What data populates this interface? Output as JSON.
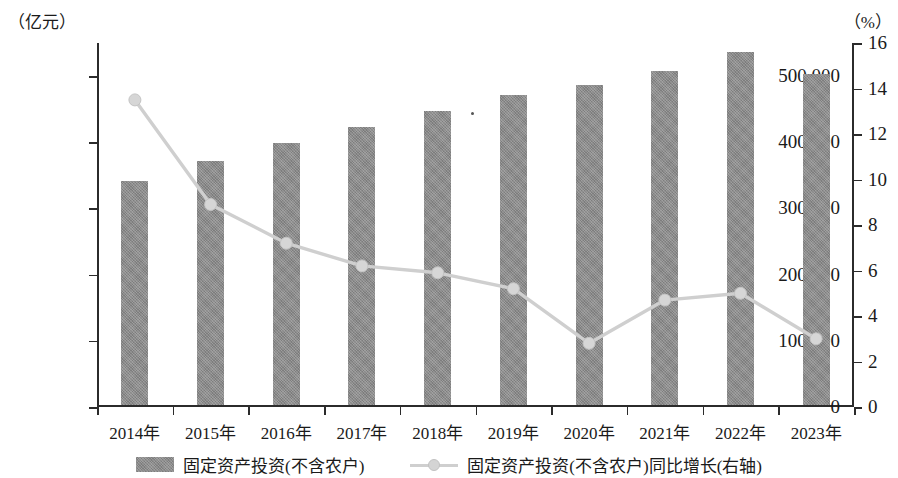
{
  "axes": {
    "left_unit": "（亿元）",
    "right_unit": "（%）",
    "left_ticks": [
      "0",
      "100 000",
      "200 000",
      "300 000",
      "400 000",
      "500 000"
    ],
    "right_ticks": [
      "0",
      "2",
      "4",
      "6",
      "8",
      "10",
      "12",
      "14",
      "16"
    ]
  },
  "legend": {
    "bar_label": "固定资产投资(不含农户)",
    "line_label": "固定资产投资(不含农户)同比增长(右轴)"
  },
  "colors": {
    "bar_fill": "#8b8b8b",
    "line_stroke": "#cfcfcf",
    "marker_fill": "#d6d6d6",
    "axis": "#2b2b2b",
    "text": "#1a1a1a"
  },
  "chart_data": {
    "type": "bar",
    "title": "",
    "subtitle": "",
    "xlabel": "",
    "ylabel": "亿元",
    "y2label": "%",
    "grid": false,
    "legend_position": "bottom",
    "categories": [
      "2014年",
      "2015年",
      "2016年",
      "2017年",
      "2018年",
      "2019年",
      "2020年",
      "2021年",
      "2022年",
      "2023年"
    ],
    "ylim": [
      0,
      550000
    ],
    "y2lim": [
      0,
      16
    ],
    "ytick_values": [
      0,
      100000,
      200000,
      300000,
      400000,
      500000
    ],
    "y2tick_values": [
      0,
      2,
      4,
      6,
      8,
      10,
      12,
      14,
      16
    ],
    "series": [
      {
        "name": "固定资产投资(不含农户)",
        "type": "bar",
        "axis": "left",
        "unit": "亿元",
        "values": [
          339100,
          370000,
          395900,
          420000,
          445000,
          469000,
          484000,
          506000,
          534000,
          501000
        ]
      },
      {
        "name": "固定资产投资(不含农户)同比增长(右轴)",
        "type": "line",
        "axis": "right",
        "unit": "%",
        "values": [
          13.5,
          8.9,
          7.2,
          6.2,
          5.9,
          5.2,
          2.8,
          4.7,
          5.0,
          3.0
        ]
      }
    ]
  }
}
